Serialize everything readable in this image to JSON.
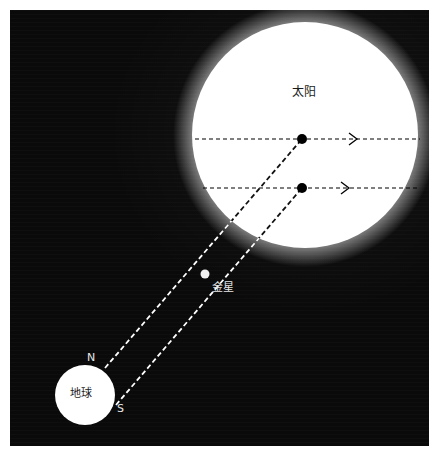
{
  "figure": {
    "kind": "astronomical-diagram",
    "background_color": "#0a0a0a",
    "frame_color": "#ffffff",
    "panel": {
      "x": 10,
      "y": 10,
      "width": 419,
      "height": 436
    }
  },
  "bodies": {
    "sun": {
      "label": "太阳",
      "color": "#ffffff",
      "center_x": 305,
      "center_y": 135,
      "radius": 113,
      "label_x": 292,
      "label_y": 86,
      "label_color": "#1a1a1a"
    },
    "venus": {
      "label": "金星",
      "color": "#f2f2f2",
      "center_x": 205,
      "center_y": 274,
      "radius": 4,
      "label_x": 212,
      "label_y": 282,
      "label_color": "#e8e8e8"
    },
    "earth": {
      "label": "地球",
      "color": "#ffffff",
      "center_x": 85,
      "center_y": 395,
      "radius": 30,
      "label_x": 70,
      "label_y": 388,
      "label_color": "#1a1a1a"
    }
  },
  "pole_markers": [
    {
      "name": "north",
      "label": "N",
      "x": 87,
      "y": 352,
      "color": "#e8e8e8"
    },
    {
      "name": "south",
      "label": "S",
      "x": 117,
      "y": 403,
      "color": "#e8e8e8"
    }
  ],
  "transit_dots": [
    {
      "name": "upper-transit-dot",
      "cx": 302,
      "cy": 139,
      "r": 5,
      "color": "#000000"
    },
    {
      "name": "lower-transit-dot",
      "cx": 302,
      "cy": 188,
      "r": 5,
      "color": "#000000"
    }
  ],
  "projection_lines": [
    {
      "name": "upper-projection-line",
      "x1": 195,
      "y1": 139,
      "x2": 420,
      "y2": 139,
      "color": "#000000",
      "arrow_x": 355,
      "arrow_y": 139
    },
    {
      "name": "lower-projection-line",
      "x1": 203,
      "y1": 188,
      "x2": 420,
      "y2": 188,
      "color": "#000000",
      "arrow_x": 347,
      "arrow_y": 188
    }
  ],
  "sight_lines": [
    {
      "name": "north-pole-sight-line",
      "from": "earth-north-limb",
      "to": "sun-upper-transit-point",
      "x1": 105,
      "y1": 368,
      "x2": 302,
      "y2": 139,
      "color": "#ffffff"
    },
    {
      "name": "south-pole-sight-line",
      "from": "earth-south-limb",
      "to": "sun-lower-transit-point",
      "x1": 116,
      "y1": 405,
      "x2": 302,
      "y2": 188,
      "color": "#ffffff"
    }
  ]
}
